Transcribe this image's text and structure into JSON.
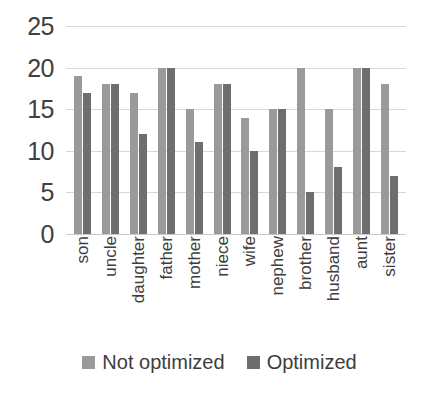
{
  "chart_data": {
    "type": "bar",
    "title": "",
    "xlabel": "",
    "ylabel": "",
    "ylim": [
      0,
      25
    ],
    "yticks": [
      0,
      5,
      10,
      15,
      20,
      25
    ],
    "grid": true,
    "legend_position": "bottom",
    "categories": [
      "son",
      "uncle",
      "daughter",
      "father",
      "mother",
      "niece",
      "wife",
      "nephew",
      "brother",
      "husband",
      "aunt",
      "sister"
    ],
    "series": [
      {
        "name": "Not optimized",
        "color": "#9a9a9a",
        "values": [
          19,
          18,
          17,
          20,
          15,
          18,
          14,
          15,
          20,
          15,
          20,
          18
        ]
      },
      {
        "name": "Optimized",
        "color": "#6e6e6e",
        "values": [
          17,
          18,
          12,
          20,
          11,
          18,
          10,
          15,
          5,
          8,
          20,
          7
        ]
      }
    ]
  }
}
